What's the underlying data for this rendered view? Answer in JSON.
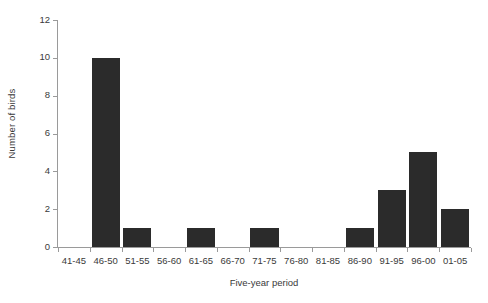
{
  "chart_data": {
    "type": "bar",
    "title": "",
    "subtitle": "",
    "xlabel": "Five-year period",
    "ylabel": "Number of birds",
    "categories": [
      "41-45",
      "46-50",
      "51-55",
      "56-60",
      "61-65",
      "66-70",
      "71-75",
      "76-80",
      "81-85",
      "86-90",
      "91-95",
      "96-00",
      "01-05"
    ],
    "values": [
      0,
      10,
      1,
      0,
      1,
      0,
      1,
      0,
      0,
      1,
      3,
      5,
      2
    ],
    "ylim": [
      0,
      12
    ],
    "yticks": [
      0,
      2,
      4,
      6,
      8,
      10,
      12
    ],
    "ytick_labels": [
      "0",
      "2",
      "4",
      "6",
      "8",
      "10",
      "12"
    ],
    "grid": false,
    "legend": false,
    "legend_position": "none",
    "bar_color": "#2b2b2b",
    "axis_color": "#9a9a9a",
    "background_color": "#ffffff",
    "text_color": "#3a3a3a",
    "annotations": []
  }
}
